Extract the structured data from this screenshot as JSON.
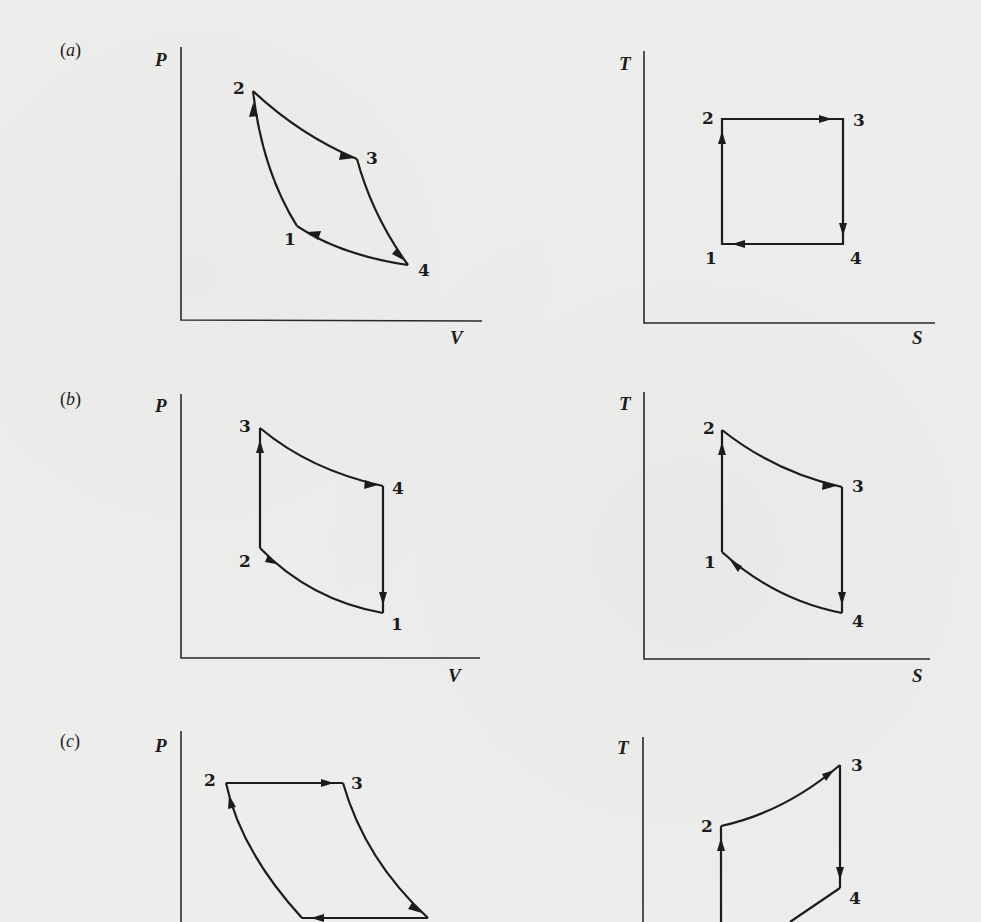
{
  "figure": {
    "background": "#ededeb",
    "ink": "#1c1c1c",
    "panels": [
      {
        "id": "a",
        "label": "(a)",
        "label_letter": "a",
        "pv": {
          "y_axis_label": "P",
          "x_axis_label": "V",
          "points": [
            {
              "n": "1",
              "label": "1"
            },
            {
              "n": "2",
              "label": "2"
            },
            {
              "n": "3",
              "label": "3"
            },
            {
              "n": "4",
              "label": "4"
            }
          ],
          "processes": [
            "1→2 adiabatic compression",
            "2→3 isothermal expansion",
            "3→4 adiabatic expansion",
            "4→1 isothermal compression"
          ]
        },
        "ts": {
          "y_axis_label": "T",
          "x_axis_label": "S",
          "points": [
            {
              "n": "1",
              "label": "1"
            },
            {
              "n": "2",
              "label": "2"
            },
            {
              "n": "3",
              "label": "3"
            },
            {
              "n": "4",
              "label": "4"
            }
          ]
        }
      },
      {
        "id": "b",
        "label": "(b)",
        "label_letter": "b",
        "pv": {
          "y_axis_label": "P",
          "x_axis_label": "V",
          "points": [
            {
              "n": "1",
              "label": "1"
            },
            {
              "n": "2",
              "label": "2"
            },
            {
              "n": "3",
              "label": "3"
            },
            {
              "n": "4",
              "label": "4"
            }
          ]
        },
        "ts": {
          "y_axis_label": "T",
          "x_axis_label": "S",
          "points": [
            {
              "n": "1",
              "label": "1"
            },
            {
              "n": "2",
              "label": "2"
            },
            {
              "n": "3",
              "label": "3"
            },
            {
              "n": "4",
              "label": "4"
            }
          ]
        }
      },
      {
        "id": "c",
        "label": "(c)",
        "label_letter": "c",
        "pv": {
          "y_axis_label": "P",
          "points": [
            {
              "n": "2",
              "label": "2"
            },
            {
              "n": "3",
              "label": "3"
            }
          ]
        },
        "ts": {
          "y_axis_label": "T",
          "points": [
            {
              "n": "2",
              "label": "2"
            },
            {
              "n": "3",
              "label": "3"
            },
            {
              "n": "4",
              "label": "4"
            }
          ]
        }
      }
    ]
  }
}
